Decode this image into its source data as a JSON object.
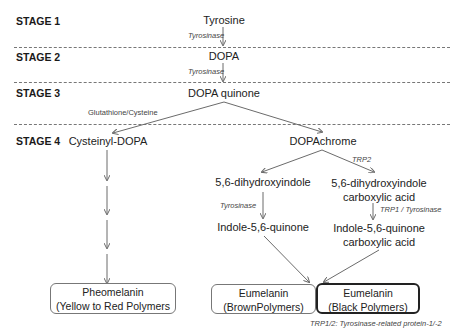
{
  "stages": [
    {
      "label": "STAGE 1"
    },
    {
      "label": "STAGE 2"
    },
    {
      "label": "STAGE 3"
    },
    {
      "label": "STAGE 4"
    }
  ],
  "nodes": {
    "tyrosine": "Tyrosine",
    "dopa": "DOPA",
    "dopa_quinone": "DOPA quinone",
    "cysteinyl_dopa": "Cysteinyl-DOPA",
    "dopachrome": "DOPAchrome",
    "dhi": "5,6-dihydroxyindole",
    "dhica_line1": "5,6-dihydroxyindole",
    "dhica_line2": "carboxylic acid",
    "iq": "Indole-5,6-quinone",
    "iqca_line1": "Indole-5,6-quinone",
    "iqca_line2": "carboxylic acid"
  },
  "enzymes": {
    "stage1_to_2": "Tyrosinase",
    "stage2_to_3": "Tyrosinase",
    "glutathione": "Glutathione/Cysteine",
    "trp2": "TRP2",
    "dhi_to_iq": "Tyrosinase",
    "dhica_to_iqca": "TRP1 / Tyrosinase"
  },
  "products": {
    "pheomelanin": {
      "title": "Pheomelanin",
      "subtitle": "(Yellow to Red Polymers"
    },
    "eumelanin_brown": {
      "title": "Eumelanin",
      "subtitle": "(BrownPolymers)"
    },
    "eumelanin_black": {
      "title": "Eumelanin",
      "subtitle": "(Black Polymers)"
    }
  },
  "footnote": "TRP1/2: Tyrosinase-related protein-1/-2",
  "colors": {
    "line": "#6b6b6b",
    "text": "#222222",
    "dark_border": "#222222"
  }
}
